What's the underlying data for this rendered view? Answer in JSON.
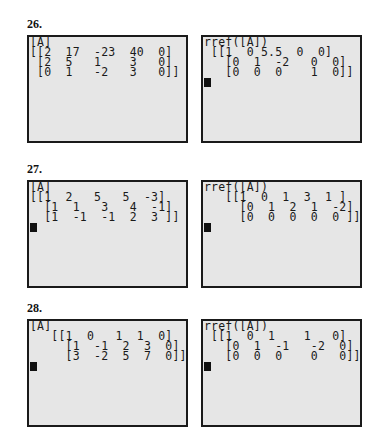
{
  "problems": [
    {
      "label": "26.",
      "left_screen": {
        "lines": [
          "[A]",
          "[[2  17  -23  40  0]",
          " [2  5   1    3   0]",
          " [0  1   -2   3   0]]"
        ],
        "cursor": false
      },
      "right_screen": {
        "lines": [
          "rref([A])",
          " [[1  0 5.5  0  0]",
          "   [0  1  -2   0  0]",
          "   [0  0  0    1  0]]"
        ],
        "cursor": true
      }
    },
    {
      "label": "27.",
      "left_screen": {
        "lines": [
          "[A]",
          "[[1  2   5   5  -3]",
          "  [1  1   3   4  -1]",
          "  [1  -1  -1  2  3 ]]"
        ],
        "cursor": true
      },
      "right_screen": {
        "lines": [
          "rref([A])",
          "   [[1  0  1  3  1 ]",
          "     [0  1  2  1  -2]",
          "     [0  0  0  0  0 ]]"
        ],
        "cursor": true
      }
    },
    {
      "label": "28.",
      "left_screen": {
        "lines": [
          "[A]",
          "   [[1  0   1  1  0]",
          "     [1  -1  2  3  0]",
          "     [3  -2  5  7  0]]"
        ],
        "cursor": true
      },
      "right_screen": {
        "lines": [
          "rref([A])",
          " [[1  0  1    1   0]",
          "   [0  1  -1   -2  0]",
          "   [0  0  0    0   0]]"
        ],
        "cursor": true
      }
    }
  ]
}
